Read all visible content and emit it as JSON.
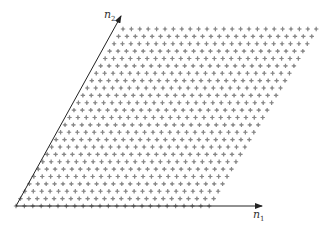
{
  "diagram": {
    "type": "lattice",
    "axes": {
      "n1": {
        "label": "n",
        "subscript": "1"
      },
      "n2": {
        "label": "n",
        "subscript": "2"
      }
    },
    "lattice": {
      "rows": 25,
      "cols": 24,
      "point_color": "#888888",
      "marker": "star"
    },
    "colors": {
      "axis": "#222222",
      "points": "#888888",
      "background": "#ffffff"
    }
  }
}
